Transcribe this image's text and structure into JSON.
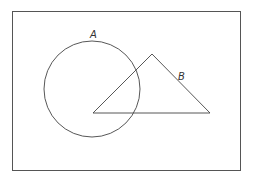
{
  "diagram": {
    "type": "venn-like",
    "universe": {
      "x": 12.5,
      "y": 11.5,
      "width": 228,
      "height": 159,
      "stroke": "#555555"
    },
    "shapes": [
      {
        "id": "A",
        "kind": "circle",
        "label": "A",
        "cx": 92,
        "cy": 89,
        "r": 48
      },
      {
        "id": "B",
        "kind": "triangle",
        "label": "B",
        "points": "93,113 152,54 210,113"
      }
    ],
    "labels": {
      "A": {
        "text": "A",
        "x": 90,
        "y": 38
      },
      "B": {
        "text": "B",
        "x": 178,
        "y": 80
      }
    },
    "stroke_color": "#444444"
  }
}
